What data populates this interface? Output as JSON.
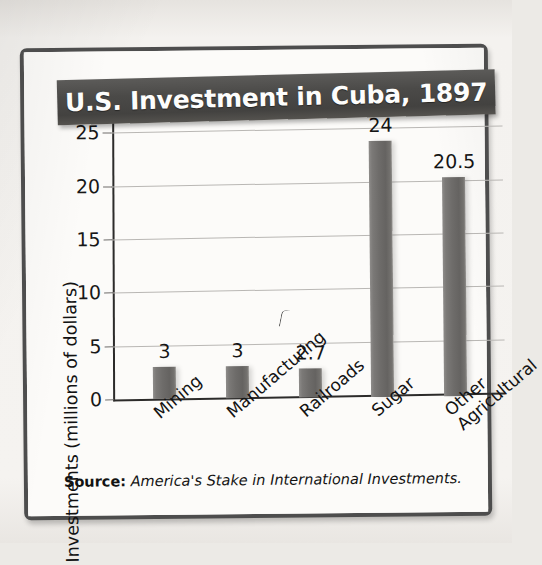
{
  "figure": {
    "title": "U.S. Investment in Cuba, 1897",
    "source_label": "Source:",
    "source_title": "America's Stake in International Investments.",
    "frame_color": "#4d4d4d",
    "banner_color": "#4b4a48",
    "bar_color": "#6e6c6a",
    "gridline_color": "#b9b7b4"
  },
  "chart_data": {
    "type": "bar",
    "title": "U.S. Investment in Cuba, 1897",
    "xlabel": "",
    "ylabel": "Investments (millions of dollars)",
    "categories": [
      "Mining",
      "Manufacturing",
      "Railroads",
      "Sugar",
      "Other Agricultural"
    ],
    "category_lines": [
      [
        "Mining"
      ],
      [
        "Manufacturing"
      ],
      [
        "Railroads"
      ],
      [
        "Sugar"
      ],
      [
        "Other",
        "Agricultural"
      ]
    ],
    "values": [
      3,
      3,
      2.7,
      24,
      20.5
    ],
    "value_labels": [
      "3",
      "3",
      "2.7",
      "24",
      "20.5"
    ],
    "ylim": [
      0,
      27
    ],
    "yticks": [
      0,
      5,
      10,
      15,
      20,
      25
    ],
    "ytick_labels": [
      "0",
      "5",
      "10",
      "15",
      "20",
      "25"
    ],
    "grid": true,
    "legend": null,
    "units": "millions of dollars",
    "year": 1897
  }
}
